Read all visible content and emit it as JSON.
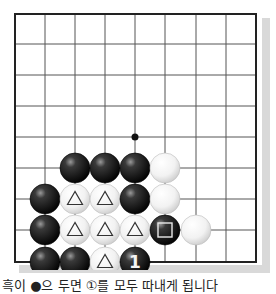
{
  "board": {
    "grid": {
      "cols_x": [
        15,
        45,
        75,
        105,
        135,
        165,
        196,
        226,
        256
      ],
      "rows_y": [
        14,
        44,
        75,
        106,
        137,
        168,
        199,
        230,
        262
      ],
      "line_color": "#555555",
      "border_color": "#222222",
      "shadow_color": "#d9d9d9"
    },
    "star_points": [
      {
        "col": 4,
        "row": 4
      }
    ],
    "stones": [
      {
        "col": 2,
        "row": 5,
        "color": "black"
      },
      {
        "col": 3,
        "row": 5,
        "color": "black"
      },
      {
        "col": 4,
        "row": 5,
        "color": "black"
      },
      {
        "col": 5,
        "row": 5,
        "color": "white"
      },
      {
        "col": 1,
        "row": 6,
        "color": "black"
      },
      {
        "col": 2,
        "row": 6,
        "color": "white",
        "mark": "triangle"
      },
      {
        "col": 3,
        "row": 6,
        "color": "white",
        "mark": "triangle"
      },
      {
        "col": 4,
        "row": 6,
        "color": "black"
      },
      {
        "col": 5,
        "row": 6,
        "color": "white"
      },
      {
        "col": 1,
        "row": 7,
        "color": "black"
      },
      {
        "col": 2,
        "row": 7,
        "color": "white",
        "mark": "triangle"
      },
      {
        "col": 3,
        "row": 7,
        "color": "white",
        "mark": "triangle"
      },
      {
        "col": 4,
        "row": 7,
        "color": "white",
        "mark": "triangle"
      },
      {
        "col": 5,
        "row": 7,
        "color": "black",
        "mark": "square"
      },
      {
        "col": 6,
        "row": 7,
        "color": "white"
      },
      {
        "col": 1,
        "row": 8,
        "color": "black"
      },
      {
        "col": 2,
        "row": 8,
        "color": "black"
      },
      {
        "col": 3,
        "row": 8,
        "color": "white",
        "mark": "triangle"
      },
      {
        "col": 4,
        "row": 8,
        "color": "black",
        "label": "1"
      }
    ]
  },
  "caption": {
    "text": "흑이 ●으 두면 ①를 모두 따내게 됩니다"
  }
}
